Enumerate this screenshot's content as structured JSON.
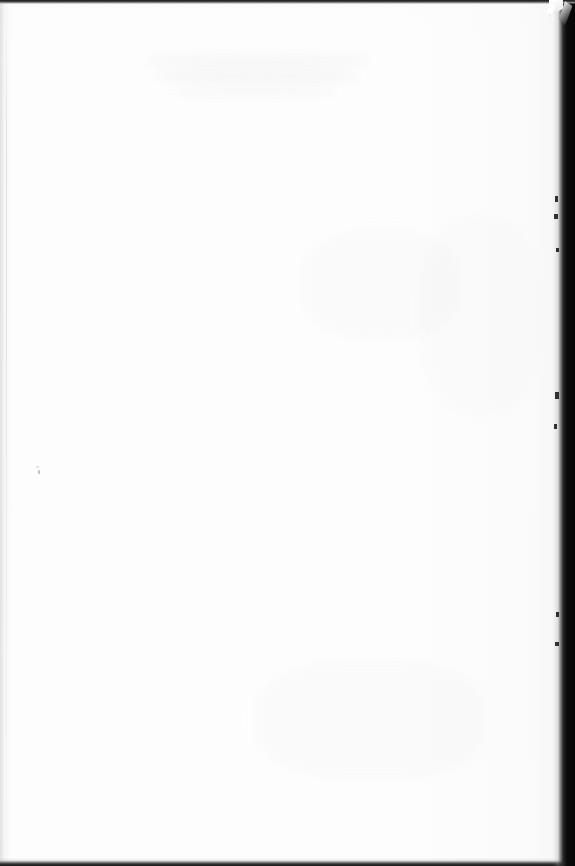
{
  "page": {
    "kind": "scanned-document-page",
    "state": "blank",
    "width": 575,
    "height": 866,
    "paper_color": "#fefefe",
    "background_color": "#ffffff",
    "visible_text": ""
  },
  "artifacts": {
    "top_edge": {
      "name": "scanner-top-edge",
      "color": "#1b1b1b",
      "height_px": 4
    },
    "right_edge": {
      "name": "scanner-right-gutter",
      "color": "#050505",
      "start_x": 553
    },
    "bottom_edge": {
      "name": "scanner-bottom-edge",
      "color": "#131313",
      "start_y": 858
    },
    "left_edge": {
      "name": "page-left-shadow",
      "color": "#e0e0e3",
      "width_px": 10
    },
    "corner_fold": {
      "name": "folded-corner-top-right",
      "color": "#0d0d0e"
    },
    "dust_speck": {
      "name": "dust-speck",
      "x": 38,
      "y": 470,
      "color": "#8c8c92"
    }
  },
  "ghost_text": {
    "note": "faint illegible bleed-through from the reverse side of the sheet",
    "color": "#b2b2b8",
    "lines": [
      "                  ",
      "                     ",
      "                ",
      "              "
    ]
  }
}
